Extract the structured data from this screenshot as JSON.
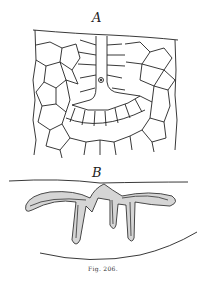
{
  "figure": {
    "panel_a_label": "A",
    "panel_b_label": "B",
    "caption": "Fig. 206.",
    "ink_color": "#222222",
    "background": "#ffffff"
  }
}
